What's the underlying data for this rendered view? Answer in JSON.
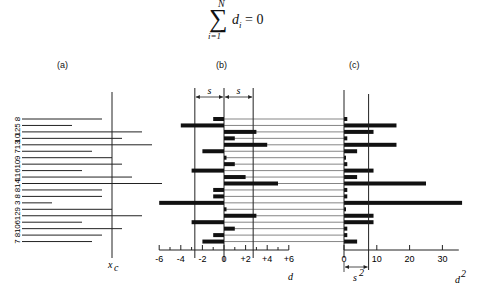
{
  "formula": {
    "sigma": "∑",
    "upper": "N",
    "lower": "i=1",
    "expression_var": "d",
    "expression_sub": "i",
    "expression_rhs": " = 0"
  },
  "panels": {
    "a": {
      "label": "(a)",
      "axis_label": "x",
      "axis_label_sub": "c"
    },
    "b": {
      "label": "(b)",
      "axis_label": "d",
      "s_label": "s"
    },
    "c": {
      "label": "(c)",
      "axis_label": "d",
      "axis_label_sup": "2",
      "s2_label": "s",
      "s2_sup": "2"
    }
  },
  "chart_data": [
    {
      "type": "bar",
      "title": "(a)",
      "orientation": "horizontal",
      "categories": [
        "8",
        "5",
        "12",
        "10",
        "13",
        "7",
        "9",
        "10",
        "6",
        "11",
        "14",
        "8",
        "8",
        "3",
        "9",
        "12",
        "6",
        "10",
        "8",
        "7"
      ],
      "values": [
        8,
        5,
        12,
        10,
        13,
        7,
        9,
        10,
        6,
        11,
        14,
        8,
        8,
        3,
        9,
        12,
        6,
        10,
        8,
        7
      ],
      "reference_line": {
        "label": "x_c",
        "value": 9
      },
      "xlabel": "",
      "ylabel": ""
    },
    {
      "type": "bar",
      "title": "(b)",
      "orientation": "horizontal",
      "values": [
        -1,
        -4,
        3,
        1,
        4,
        -2,
        0,
        1,
        -3,
        2,
        5,
        -1,
        -1,
        -6,
        0,
        3,
        -3,
        1,
        -1,
        -2
      ],
      "xlabel": "d",
      "xticks": [
        "-6",
        "-4",
        "-2",
        "0",
        "+2",
        "+4",
        "+6"
      ],
      "xlim": [
        -6,
        6
      ],
      "reference_lines": [
        {
          "label": "-s",
          "value": -2.7
        },
        {
          "label": "+s",
          "value": 2.7
        }
      ]
    },
    {
      "type": "bar",
      "title": "(c)",
      "orientation": "horizontal",
      "values": [
        1,
        16,
        9,
        1,
        16,
        4,
        0,
        1,
        9,
        4,
        25,
        1,
        1,
        36,
        0,
        9,
        9,
        1,
        1,
        4
      ],
      "xlabel": "d²",
      "xticks": [
        "0",
        "10",
        "20",
        "30"
      ],
      "xlim": [
        0,
        33
      ],
      "reference_lines": [
        {
          "label": "s²",
          "value": 7.5
        }
      ]
    }
  ],
  "rows": {
    "labels": [
      "8",
      "5",
      "12",
      "10",
      "13",
      "7",
      "9",
      "10",
      "6",
      "11",
      "14",
      "8",
      "8",
      "3",
      "9",
      "12",
      "6",
      "10",
      "8",
      "7"
    ],
    "x": [
      8,
      5,
      12,
      10,
      13,
      7,
      9,
      10,
      6,
      11,
      14,
      8,
      8,
      3,
      9,
      12,
      6,
      10,
      8,
      7
    ],
    "d": [
      -1,
      -4,
      3,
      1,
      4,
      -2,
      0,
      1,
      -3,
      2,
      5,
      -1,
      -1,
      -6,
      0,
      3,
      -3,
      1,
      -1,
      -2
    ],
    "d2": [
      1,
      16,
      9,
      1,
      16,
      4,
      0,
      1,
      9,
      4,
      25,
      1,
      1,
      36,
      0,
      9,
      9,
      1,
      1,
      4
    ]
  },
  "axes": {
    "b_ticks": [
      "-6",
      "-4",
      "-2",
      "0",
      "+2",
      "+4",
      "+6"
    ],
    "c_ticks": [
      "0",
      "10",
      "20",
      "30"
    ]
  }
}
